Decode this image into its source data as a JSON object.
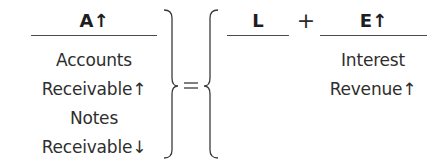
{
  "equation": {
    "assets": {
      "heading": "A↑",
      "items": [
        "Accounts",
        "Receivable↑",
        "Notes",
        "Receivable↓"
      ]
    },
    "equals_sign": "=",
    "liabilities": {
      "heading": "L",
      "items": []
    },
    "plus_sign": "+",
    "equity": {
      "heading": "E↑",
      "items": [
        "Interest",
        "Revenue↑"
      ]
    }
  },
  "colors": {
    "text": "#2e2e2e",
    "rule": "#4a4a4a"
  }
}
